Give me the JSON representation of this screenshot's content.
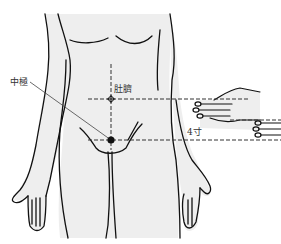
{
  "diagram": {
    "title": "",
    "labels": {
      "acupoint": "中極",
      "navel": "肚臍",
      "measurement": "4寸"
    },
    "points": [
      {
        "name": "navel",
        "label": "肚臍",
        "x": 111,
        "y": 99,
        "style": "hollow-cross"
      },
      {
        "name": "zhongji",
        "label": "中極",
        "x": 111,
        "y": 140,
        "style": "filled"
      }
    ],
    "measurement": {
      "from": "navel",
      "to": "zhongji",
      "value": "4寸",
      "method": "finger-width (two hands, 4 fingers)"
    },
    "colors": {
      "background": "#ffffff",
      "body_fill": "#eeeeee",
      "outline": "#111111",
      "guide_line": "#333333"
    }
  }
}
